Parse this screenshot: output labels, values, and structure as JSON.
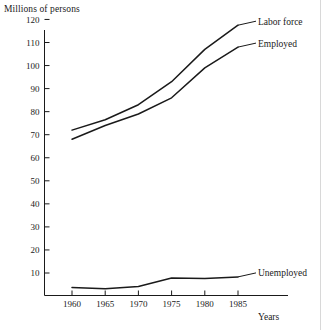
{
  "chart_data": {
    "type": "line",
    "title": "",
    "ylabel": "Millions of persons",
    "xlabel": "Years",
    "categories": [
      1960,
      1965,
      1970,
      1975,
      1980,
      1985
    ],
    "xtick_labels": [
      "1960",
      "1965",
      "1970",
      "1975",
      "1980",
      "1985"
    ],
    "ytick_labels": [
      "10",
      "20",
      "30",
      "40",
      "50",
      "60",
      "70",
      "80",
      "90",
      "100",
      "110",
      "120"
    ],
    "ytick_values": [
      10,
      20,
      30,
      40,
      50,
      60,
      70,
      80,
      90,
      100,
      110,
      120
    ],
    "xlim": [
      1957,
      1988
    ],
    "ylim": [
      0,
      125
    ],
    "grid": false,
    "legend_position": "right-of-line-ends",
    "series": [
      {
        "name": "Labor force",
        "values": [
          72,
          76.5,
          83,
          93,
          107,
          117.5
        ]
      },
      {
        "name": "Employed",
        "values": [
          68,
          74,
          79,
          86,
          99,
          108
        ]
      },
      {
        "name": "Unemployed",
        "values": [
          3.7,
          3.2,
          4.1,
          7.8,
          7.6,
          8.3
        ]
      }
    ],
    "colors": {
      "line": "#1a1a1a",
      "axis": "#1a1a1a",
      "background": "#ffffff"
    }
  }
}
